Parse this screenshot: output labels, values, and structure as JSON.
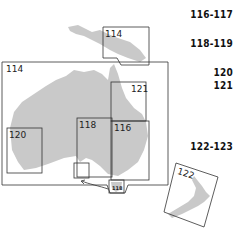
{
  "map": {
    "boxes": {
      "png": {
        "label": "114"
      },
      "australia": {
        "label": "114"
      },
      "queensland": {
        "label": "121"
      },
      "south_australia": {
        "label": "118"
      },
      "nsw": {
        "label": "116"
      },
      "western_australia": {
        "label": "120"
      },
      "tasmania": {
        "label": "118"
      },
      "new_zealand": {
        "label": "122"
      }
    },
    "page_refs": [
      "116-117",
      "118-119",
      "120",
      "121",
      "122-123"
    ],
    "colors": {
      "land": "#c9c9c9",
      "frame": "#333333"
    }
  }
}
